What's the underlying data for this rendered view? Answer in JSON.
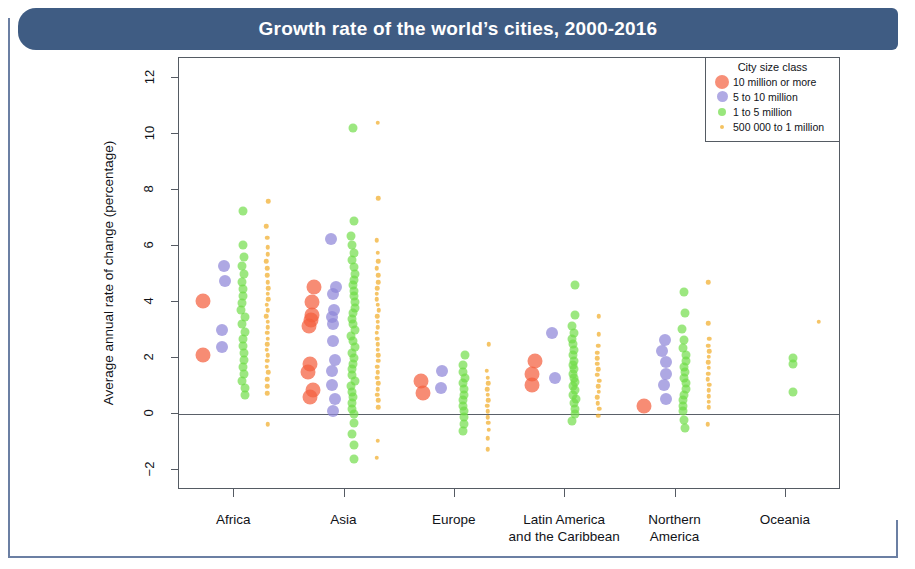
{
  "title": "Growth rate of the world’s cities, 2000-2016",
  "legend": {
    "title": "City size class",
    "items": [
      {
        "label": "10 million or more",
        "color": "#f4603e",
        "size": 14
      },
      {
        "label": "5 to 10 million",
        "color": "#8f86d8",
        "size": 11
      },
      {
        "label": "1 to 5 million",
        "color": "#6ddb44",
        "size": 8
      },
      {
        "label": "500 000 to 1 million",
        "color": "#f0a81e",
        "size": 4
      }
    ]
  },
  "chart_data": {
    "type": "scatter",
    "title": "Growth rate of the world’s cities, 2000-2016",
    "xlabel": "",
    "ylabel": "Average annual rate of change (percentage)",
    "ylim": [
      -2.7,
      12.7
    ],
    "yticks": [
      -2,
      0,
      2,
      4,
      6,
      8,
      10,
      12
    ],
    "ytick_labels": [
      "−2",
      "0",
      "2",
      "4",
      "6",
      "8",
      "10",
      "12"
    ],
    "grid": false,
    "zero_line": 0,
    "legend_position": "top-right",
    "categories": [
      "Africa",
      "Asia",
      "Europe",
      "Latin America\nand the Caribbean",
      "Northern\nAmerica",
      "Oceania"
    ],
    "category_labels": [
      [
        "Africa"
      ],
      [
        "Asia"
      ],
      [
        "Europe"
      ],
      [
        "Latin America",
        "and the Caribbean"
      ],
      [
        "Northern",
        "America"
      ],
      [
        "Oceania"
      ]
    ],
    "series": [
      {
        "name": "10 million or more",
        "color": "#f4603e",
        "marker_size": 15,
        "offset": -0.3,
        "values_by_category": {
          "Africa": [
            4.05,
            2.1
          ],
          "Asia": [
            4.55,
            4.0,
            3.55,
            3.35,
            3.15,
            1.8,
            1.5,
            0.85,
            0.6
          ],
          "Europe": [
            1.2,
            0.75
          ],
          "Latin America and the Caribbean": [
            1.9,
            1.45,
            1.05
          ],
          "Northern America": [
            0.3
          ],
          "Oceania": []
        }
      },
      {
        "name": "5 to 10 million",
        "color": "#8f86d8",
        "marker_size": 12,
        "offset": -0.1,
        "values_by_category": {
          "Africa": [
            5.3,
            4.75,
            3.0,
            2.4
          ],
          "Asia": [
            6.25,
            4.55,
            4.3,
            3.7,
            3.45,
            3.2,
            2.6,
            1.95,
            1.55,
            1.05,
            0.55,
            0.1
          ],
          "Europe": [
            1.55,
            0.95
          ],
          "Latin America and the Caribbean": [
            2.9,
            1.3
          ],
          "Northern America": [
            2.65,
            2.25,
            1.85,
            1.45,
            1.05,
            0.55
          ],
          "Oceania": []
        }
      },
      {
        "name": "1 to 5 million",
        "color": "#6ddb44",
        "marker_size": 9,
        "offset": 0.08,
        "values_by_category": {
          "Africa": [
            7.25,
            6.05,
            5.6,
            5.3,
            5.0,
            4.7,
            4.45,
            4.2,
            3.95,
            3.7,
            3.45,
            3.2,
            2.95,
            2.7,
            2.45,
            2.2,
            1.95,
            1.7,
            1.45,
            1.2,
            0.95,
            0.7
          ],
          "Europe": [
            2.1,
            1.75,
            1.5,
            1.3,
            1.1,
            0.9,
            0.7,
            0.5,
            0.3,
            0.1,
            -0.1,
            -0.35,
            -0.6
          ],
          "Asia": [
            10.2,
            6.9,
            6.35,
            6.05,
            5.75,
            5.5,
            5.25,
            5.0,
            4.8,
            4.6,
            4.4,
            4.2,
            4.0,
            3.8,
            3.6,
            3.4,
            3.2,
            3.0,
            2.8,
            2.6,
            2.4,
            2.2,
            2.0,
            1.8,
            1.6,
            1.4,
            1.2,
            1.0,
            0.8,
            0.6,
            0.4,
            0.2,
            0.0,
            -0.3,
            -0.7,
            -1.1,
            -1.6
          ],
          "Latin America and the Caribbean": [
            4.6,
            3.55,
            3.15,
            2.9,
            2.7,
            2.5,
            2.3,
            2.1,
            1.9,
            1.75,
            1.6,
            1.45,
            1.3,
            1.15,
            1.0,
            0.85,
            0.7,
            0.55,
            0.4,
            0.2,
            0.0,
            -0.25
          ],
          "Northern America": [
            4.35,
            3.6,
            3.05,
            2.65,
            2.35,
            2.1,
            1.9,
            1.7,
            1.5,
            1.3,
            1.1,
            0.9,
            0.7,
            0.5,
            0.3,
            0.1,
            -0.2,
            -0.5
          ],
          "Oceania": [
            2.0,
            1.8,
            0.8
          ]
        }
      },
      {
        "name": "500 000 to 1 million",
        "color": "#f0a81e",
        "marker_size": 4.5,
        "offset": 0.3,
        "values_by_category": {
          "Africa": [
            7.6,
            6.7,
            6.3,
            5.95,
            5.7,
            5.45,
            5.2,
            4.95,
            4.7,
            4.5,
            4.3,
            4.1,
            3.9,
            3.7,
            3.5,
            3.3,
            3.1,
            2.9,
            2.7,
            2.5,
            2.3,
            2.1,
            1.9,
            1.7,
            1.5,
            1.25,
            1.0,
            0.75,
            -0.35
          ],
          "Asia": [
            10.4,
            7.7,
            6.2,
            5.75,
            5.45,
            5.2,
            4.95,
            4.7,
            4.5,
            4.3,
            4.1,
            3.9,
            3.7,
            3.5,
            3.3,
            3.1,
            2.9,
            2.7,
            2.5,
            2.3,
            2.1,
            1.9,
            1.7,
            1.5,
            1.3,
            1.1,
            0.9,
            0.7,
            0.5,
            0.25,
            -0.95,
            -1.55
          ],
          "Europe": [
            2.5,
            1.55,
            1.3,
            1.1,
            0.9,
            0.7,
            0.5,
            0.3,
            0.1,
            -0.1,
            -0.3,
            -0.55,
            -0.85,
            -1.25
          ],
          "Latin America and the Caribbean": [
            3.5,
            2.85,
            2.45,
            2.2,
            2.0,
            1.8,
            1.6,
            1.4,
            1.2,
            1.0,
            0.8,
            0.6,
            0.4,
            0.2,
            -0.05
          ],
          "Northern America": [
            4.7,
            3.25,
            2.7,
            2.45,
            2.25,
            2.05,
            1.85,
            1.65,
            1.45,
            1.25,
            1.05,
            0.85,
            0.65,
            0.45,
            0.25,
            -0.35
          ],
          "Oceania": [
            3.3
          ]
        }
      }
    ]
  }
}
